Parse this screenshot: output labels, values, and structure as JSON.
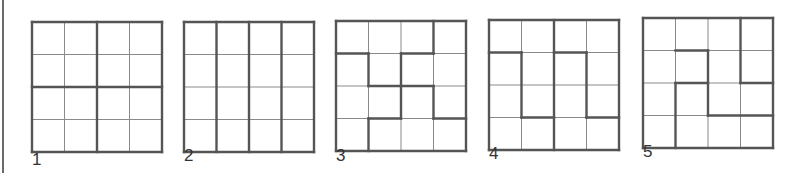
{
  "figure": {
    "grid_size": 4,
    "colors": {
      "thin_line": "#8a8a8a",
      "thick_line": "#555555",
      "background": "#ffffff"
    },
    "puzzles": [
      {
        "label": "1",
        "x": 32,
        "y": 22,
        "cell": 32.5,
        "label_x": 32,
        "label_y": 150,
        "thick": [
          [
            0,
            0,
            4,
            0
          ],
          [
            0,
            4,
            4,
            4
          ],
          [
            0,
            0,
            0,
            4
          ],
          [
            4,
            0,
            4,
            4
          ],
          [
            2,
            0,
            2,
            4
          ],
          [
            0,
            2,
            4,
            2
          ]
        ]
      },
      {
        "label": "2",
        "x": 184,
        "y": 22,
        "cell": 32.5,
        "label_x": 184,
        "label_y": 146,
        "thick": [
          [
            0,
            0,
            4,
            0
          ],
          [
            0,
            4,
            4,
            4
          ],
          [
            0,
            0,
            0,
            4
          ],
          [
            4,
            0,
            4,
            4
          ],
          [
            1,
            0,
            1,
            4
          ],
          [
            2,
            0,
            2,
            4
          ],
          [
            3,
            0,
            3,
            4
          ]
        ]
      },
      {
        "label": "3",
        "x": 336,
        "y": 21,
        "cell": 32.5,
        "label_x": 336,
        "label_y": 146,
        "thick": [
          [
            0,
            0,
            4,
            0
          ],
          [
            0,
            4,
            4,
            4
          ],
          [
            0,
            0,
            0,
            4
          ],
          [
            4,
            0,
            4,
            4
          ],
          [
            0,
            1,
            1,
            1
          ],
          [
            2,
            1,
            3,
            1
          ],
          [
            3,
            0,
            3,
            1
          ],
          [
            1,
            1,
            1,
            2
          ],
          [
            1,
            2,
            2,
            2
          ],
          [
            2,
            1,
            2,
            3
          ],
          [
            2,
            2,
            3,
            2
          ],
          [
            3,
            2,
            3,
            3
          ],
          [
            3,
            3,
            4,
            3
          ],
          [
            1,
            3,
            2,
            3
          ],
          [
            1,
            3,
            1,
            4
          ]
        ]
      },
      {
        "label": "4",
        "x": 489,
        "y": 20,
        "cell": 32.5,
        "label_x": 489,
        "label_y": 144,
        "thick": [
          [
            0,
            0,
            4,
            0
          ],
          [
            0,
            4,
            4,
            4
          ],
          [
            0,
            0,
            0,
            4
          ],
          [
            4,
            0,
            4,
            4
          ],
          [
            2,
            0,
            2,
            4
          ],
          [
            0,
            1,
            1,
            1
          ],
          [
            2,
            1,
            3,
            1
          ],
          [
            1,
            1,
            1,
            3
          ],
          [
            1,
            3,
            2,
            3
          ],
          [
            3,
            1,
            3,
            3
          ],
          [
            3,
            3,
            4,
            3
          ]
        ]
      },
      {
        "label": "5",
        "x": 643,
        "y": 18,
        "cell": 32.5,
        "label_x": 643,
        "label_y": 142,
        "thick": [
          [
            0,
            0,
            4,
            0
          ],
          [
            0,
            4,
            4,
            4
          ],
          [
            0,
            0,
            0,
            4
          ],
          [
            4,
            0,
            4,
            4
          ],
          [
            3,
            0,
            3,
            2
          ],
          [
            1,
            1,
            2,
            1
          ],
          [
            2,
            1,
            2,
            3
          ],
          [
            1,
            2,
            2,
            2
          ],
          [
            3,
            2,
            4,
            2
          ],
          [
            1,
            2,
            1,
            4
          ],
          [
            2,
            3,
            4,
            3
          ]
        ]
      }
    ]
  }
}
